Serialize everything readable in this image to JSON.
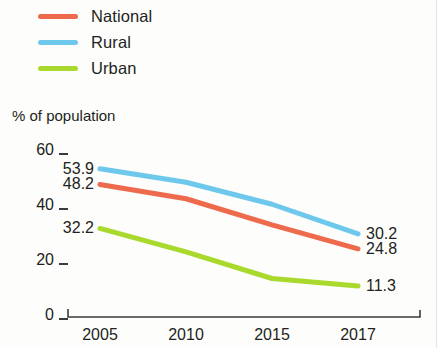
{
  "legend": {
    "items": [
      {
        "label": "National",
        "color": "#ee6a4d"
      },
      {
        "label": "Rural",
        "color": "#6ec8ec"
      },
      {
        "label": "Urban",
        "color": "#a8d92c"
      }
    ]
  },
  "axis_title": "% of population",
  "y_ticks": [
    "60",
    "40",
    "20",
    "0"
  ],
  "x_ticks": [
    "2005",
    "2010",
    "2015",
    "2017"
  ],
  "start_labels": {
    "rural": "53.9",
    "national": "48.2",
    "urban": "32.2"
  },
  "end_labels": {
    "rural": "30.2",
    "national": "24.8",
    "urban": "11.3"
  },
  "chart_data": {
    "type": "line",
    "title": "",
    "xlabel": "",
    "ylabel": "% of population",
    "categories": [
      "2005",
      "2010",
      "2015",
      "2017"
    ],
    "ylim": [
      0,
      60
    ],
    "yticks": [
      0,
      20,
      40,
      60
    ],
    "grid": false,
    "legend_position": "top-left",
    "series": [
      {
        "name": "National",
        "color": "#ee6a4d",
        "values": [
          48.2,
          43.0,
          33.5,
          24.8
        ],
        "endpoint_labels": {
          "first": "48.2",
          "last": "24.8"
        }
      },
      {
        "name": "Rural",
        "color": "#6ec8ec",
        "values": [
          53.9,
          49.0,
          41.0,
          30.2
        ],
        "endpoint_labels": {
          "first": "53.9",
          "last": "30.2"
        }
      },
      {
        "name": "Urban",
        "color": "#a8d92c",
        "values": [
          32.2,
          23.7,
          14.0,
          11.3
        ],
        "endpoint_labels": {
          "first": "32.2",
          "last": "11.3"
        }
      }
    ]
  }
}
